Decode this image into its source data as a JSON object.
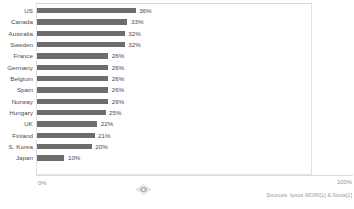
{
  "chart_data": {
    "type": "bar",
    "orientation": "horizontal",
    "title": "",
    "subtitle": "",
    "xlabel": "",
    "ylabel": "",
    "xlim": [
      0,
      100
    ],
    "grid": false,
    "legend": null,
    "categories": [
      "US",
      "Canada",
      "Australia",
      "Sweden",
      "France",
      "Germany",
      "Belgium",
      "Spain",
      "Norway",
      "Hungary",
      "UK",
      "Finland",
      "S. Korea",
      "Japan"
    ],
    "values": [
      36,
      33,
      32,
      32,
      26,
      26,
      26,
      26,
      26,
      25,
      22,
      21,
      20,
      10
    ],
    "value_labels": [
      "36%",
      "33%",
      "32%",
      "32%",
      "26%",
      "26%",
      "26%",
      "26%",
      "26%",
      "25%",
      "22%",
      "21%",
      "20%",
      "10%"
    ],
    "axis_ticks": {
      "min_label": "0%",
      "max_label": "100%"
    },
    "annotations": {
      "source": "Sources: Ipsos MORI[1] & Nova[1]"
    },
    "colors": {
      "bar": "#6d6d6d",
      "background": "#ffffff",
      "frame": "#e2e2e2",
      "label_text": "#4a4a4a",
      "tick_text": "#8e8e8e",
      "source_text": "#9a9a9a"
    }
  },
  "icons": {
    "watermark": "watermark-logo-icon"
  }
}
